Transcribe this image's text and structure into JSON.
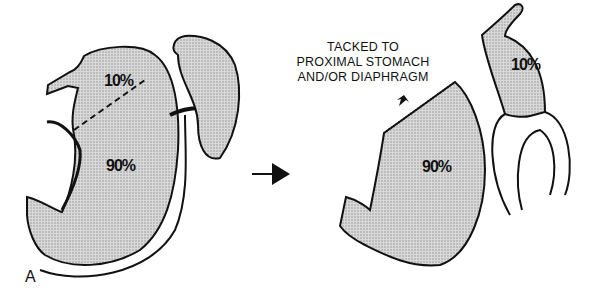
{
  "figure": {
    "panel_label": "A",
    "left": {
      "upper_portion_label": "10%",
      "lower_portion_label": "90%"
    },
    "right": {
      "caption_lines": [
        "TACKED TO",
        "PROXIMAL STOMACH",
        "AND/OR DIAPHRAGM"
      ],
      "stomach_label": "90%",
      "pouch_label": "10%"
    },
    "colors": {
      "fill": "#c8c8c8",
      "stroke": "#111111",
      "background": "#ffffff"
    }
  }
}
